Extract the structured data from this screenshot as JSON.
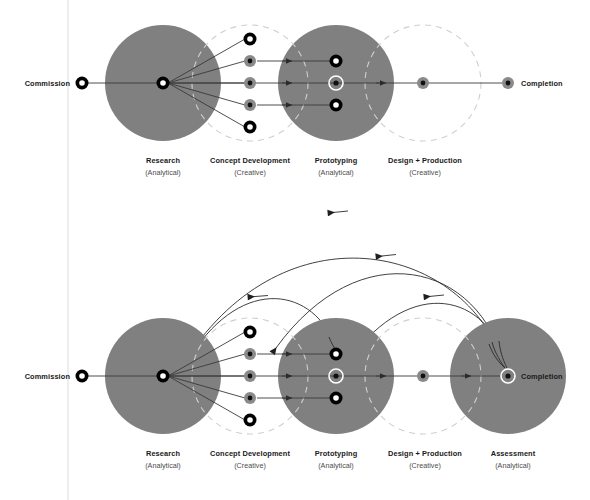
{
  "figure": {
    "background_color": "#ffffff",
    "phase_fill_color": "#808080",
    "dashed_stroke_color": "#cfcfcf",
    "line_color": "#3a3a3a",
    "guide_line_x": 68
  },
  "endpoints": {
    "commission_label": "Commission",
    "completion_label": "Completion"
  },
  "diagrams": [
    {
      "id": "linear-process",
      "axis_y": 83,
      "commission_node": {
        "x": 82,
        "y": 83,
        "style": "black-ring-white-core",
        "r": 6
      },
      "completion_node": {
        "x": 508,
        "y": 83,
        "style": "gray-disc-black-dot",
        "r": 6
      },
      "phases": [
        {
          "key": "research",
          "label": "Research",
          "mode": "(Analytical)",
          "kind": "solid",
          "cx": 163,
          "cy": 83,
          "r": 58,
          "label_x": 163,
          "label_y": 163
        },
        {
          "key": "concept-development",
          "label": "Concept Development",
          "mode": "(Creative)",
          "kind": "dashed",
          "cx": 250,
          "cy": 83,
          "r": 58,
          "label_x": 250,
          "label_y": 163
        },
        {
          "key": "prototyping",
          "label": "Prototyping",
          "mode": "(Analytical)",
          "kind": "solid",
          "cx": 336,
          "cy": 83,
          "r": 58,
          "label_x": 336,
          "label_y": 163
        },
        {
          "key": "design-production",
          "label": "Design + Production",
          "mode": "(Creative)",
          "kind": "dashed",
          "cx": 423,
          "cy": 83,
          "r": 58,
          "label_x": 423,
          "label_y": 163
        }
      ],
      "hub_node": {
        "x": 163,
        "y": 83,
        "style": "black-ring-white-core",
        "r": 6
      },
      "concept_nodes": [
        {
          "x": 250,
          "y": 39,
          "style": "black-ring-white-core",
          "r": 6.5
        },
        {
          "x": 250,
          "y": 61,
          "style": "gray-disc-black-dot",
          "r": 6
        },
        {
          "x": 250,
          "y": 83,
          "style": "gray-disc-black-dot",
          "r": 6
        },
        {
          "x": 250,
          "y": 105,
          "style": "gray-disc-black-dot",
          "r": 6
        },
        {
          "x": 250,
          "y": 127,
          "style": "black-ring-white-core",
          "r": 6.5
        }
      ],
      "prototype_nodes": [
        {
          "x": 336,
          "y": 61,
          "style": "black-ring-white-core",
          "r": 6.5
        },
        {
          "x": 336,
          "y": 83,
          "style": "white-ring-dark-dot",
          "r": 7.5
        },
        {
          "x": 336,
          "y": 105,
          "style": "black-ring-white-core",
          "r": 6.5
        }
      ],
      "production_node": {
        "x": 423,
        "y": 83,
        "style": "gray-disc-black-dot",
        "r": 6
      },
      "short_arrow_xs": [
        291,
        291,
        291
      ],
      "axis_arrow_x": 385,
      "commission_label_pos": {
        "x": 70,
        "y": 86
      },
      "completion_label_pos": {
        "x": 521,
        "y": 86
      }
    },
    {
      "id": "iterative-process",
      "axis_y": 376,
      "commission_node": {
        "x": 82,
        "y": 376,
        "style": "black-ring-white-core",
        "r": 6
      },
      "completion_node": {
        "x": 508,
        "y": 376,
        "style": "white-ring-dark-dot",
        "r": 7.5
      },
      "phases": [
        {
          "key": "research",
          "label": "Research",
          "mode": "(Analytical)",
          "kind": "solid",
          "cx": 163,
          "cy": 376,
          "r": 58,
          "label_x": 163,
          "label_y": 456
        },
        {
          "key": "concept-development",
          "label": "Concept Development",
          "mode": "(Creative)",
          "kind": "dashed",
          "cx": 250,
          "cy": 376,
          "r": 58,
          "label_x": 250,
          "label_y": 456
        },
        {
          "key": "prototyping",
          "label": "Prototyping",
          "mode": "(Analytical)",
          "kind": "solid",
          "cx": 336,
          "cy": 376,
          "r": 58,
          "label_x": 336,
          "label_y": 456
        },
        {
          "key": "design-production",
          "label": "Design + Production",
          "mode": "(Creative)",
          "kind": "dashed",
          "cx": 423,
          "cy": 376,
          "r": 58,
          "label_x": 423,
          "label_y": 456
        },
        {
          "key": "assessment",
          "label": "Assessment",
          "mode": "(Analytical)",
          "kind": "solid",
          "cx": 508,
          "cy": 376,
          "r": 58,
          "label_x": 508,
          "label_y": 456
        }
      ],
      "hub_node": {
        "x": 163,
        "y": 376,
        "style": "black-ring-white-core",
        "r": 6
      },
      "concept_nodes": [
        {
          "x": 250,
          "y": 332,
          "style": "black-ring-white-core",
          "r": 6.5
        },
        {
          "x": 250,
          "y": 354,
          "style": "gray-disc-black-dot",
          "r": 6
        },
        {
          "x": 250,
          "y": 376,
          "style": "gray-disc-black-dot",
          "r": 6
        },
        {
          "x": 250,
          "y": 398,
          "style": "gray-disc-black-dot",
          "r": 6
        },
        {
          "x": 250,
          "y": 420,
          "style": "black-ring-white-core",
          "r": 6.5
        }
      ],
      "prototype_nodes": [
        {
          "x": 336,
          "y": 354,
          "style": "black-ring-white-core",
          "r": 6.5
        },
        {
          "x": 336,
          "y": 376,
          "style": "white-ring-dark-dot",
          "r": 7.5
        },
        {
          "x": 336,
          "y": 398,
          "style": "black-ring-white-core",
          "r": 6.5
        }
      ],
      "production_node": {
        "x": 423,
        "y": 376,
        "style": "gray-disc-black-dot",
        "r": 6
      },
      "short_arrow_xs": [
        291,
        291,
        291
      ],
      "axis_arrow_x": 385,
      "axis_arrow_x2": 470,
      "commission_label_pos": {
        "x": 70,
        "y": 379
      },
      "completion_label_pos": {
        "x": 521,
        "y": 379
      },
      "feedback_arcs": [
        {
          "from": "completion",
          "to": "research",
          "apex_y": 212,
          "arrowhead_count": 2
        },
        {
          "from": "completion",
          "to": "concept-development",
          "apex_y": 258,
          "arrowhead_count": 2
        },
        {
          "from": "completion",
          "to": "prototyping",
          "apex_y": 296,
          "arrowhead_count": 1
        },
        {
          "from": "prototyping",
          "to": "research",
          "apex_y": 288,
          "arrowhead_count": 1
        }
      ]
    }
  ]
}
